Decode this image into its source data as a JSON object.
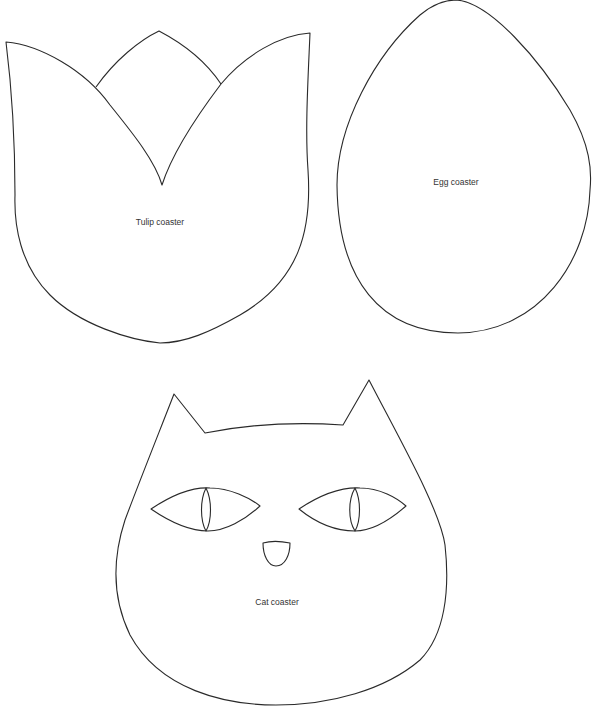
{
  "page": {
    "background": "#ffffff",
    "stroke_color": "#2a2a2a"
  },
  "shapes": {
    "tulip": {
      "label": "Tulip coaster"
    },
    "egg": {
      "label": "Egg coaster"
    },
    "cat": {
      "label": "Cat coaster"
    }
  }
}
